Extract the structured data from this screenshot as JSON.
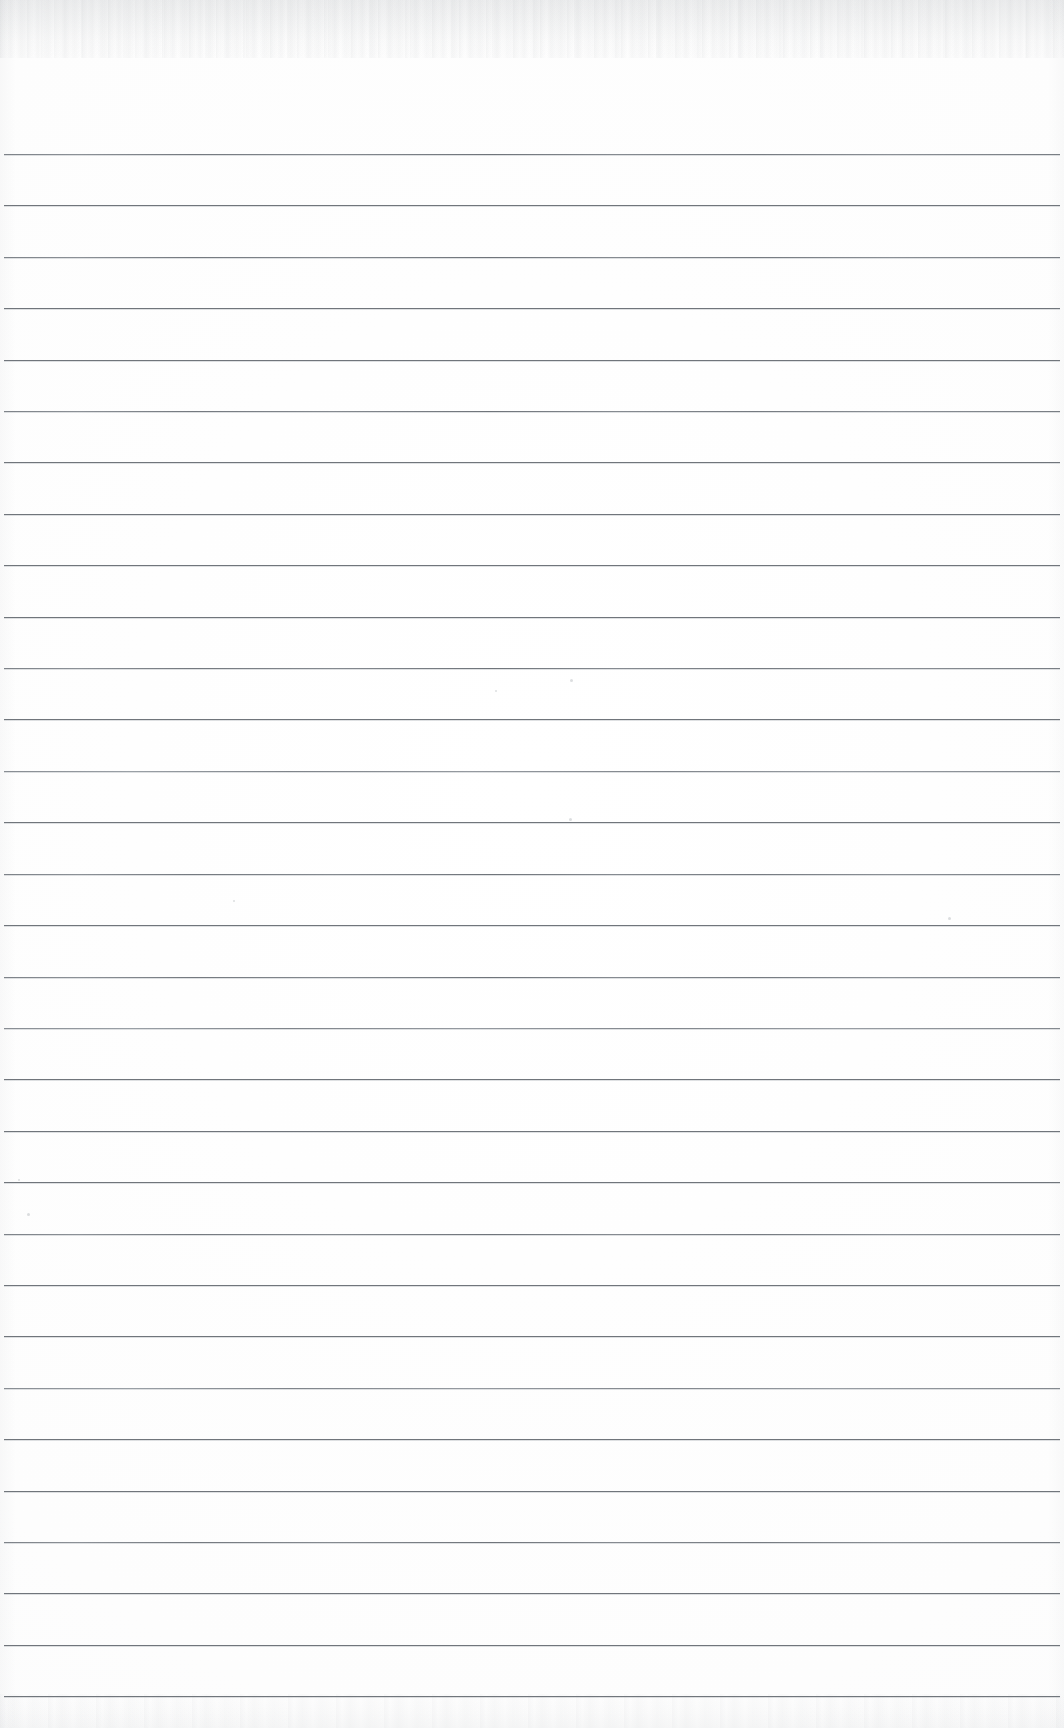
{
  "document": {
    "type": "scanned-lined-notebook-page",
    "title": "Blank lined notebook page",
    "page_width": 1064,
    "page_height": 1728,
    "background_color": "#fdfdfd",
    "content_text": "",
    "has_handwriting": false,
    "has_printed_text": false
  },
  "ruling": {
    "line_color": "#70757b",
    "line_thickness_px": 1,
    "line_spacing_px": 51.4,
    "first_line_y": 154,
    "last_line_y": 1695,
    "line_count": 31,
    "left_margin_x": 4,
    "right_margin_x": 1060,
    "margin_rule": "none",
    "line_positions_y": [
      154,
      205,
      257,
      308,
      360,
      411,
      462,
      514,
      565,
      617,
      668,
      719,
      771,
      822,
      874,
      925,
      977,
      1028,
      1079,
      1131,
      1182,
      1234,
      1285,
      1336,
      1388,
      1439,
      1491,
      1542,
      1593,
      1645,
      1696
    ],
    "line_styles": [
      "faint",
      "normal",
      "faint",
      "normal",
      "normal",
      "faint",
      "normal",
      "normal",
      "normal",
      "normal",
      "faint",
      "normal",
      "light",
      "normal",
      "faint",
      "normal",
      "faint",
      "light",
      "normal",
      "normal",
      "normal",
      "faint",
      "normal",
      "normal",
      "light",
      "normal",
      "normal",
      "faint",
      "normal",
      "normal",
      "normal"
    ]
  },
  "scan_artifacts": {
    "top_edge_noise": true,
    "bottom_edge_smudge": true,
    "left_edge_shading": true,
    "right_edge_shading": true,
    "specks": [
      {
        "x": 570,
        "y": 679,
        "size": 3
      },
      {
        "x": 569,
        "y": 818,
        "size": 3
      },
      {
        "x": 948,
        "y": 917,
        "size": 3
      },
      {
        "x": 27,
        "y": 1213,
        "size": 3
      },
      {
        "x": 495,
        "y": 690,
        "size": 2
      },
      {
        "x": 233,
        "y": 900,
        "size": 2
      },
      {
        "x": 18,
        "y": 1179,
        "size": 2
      }
    ]
  }
}
